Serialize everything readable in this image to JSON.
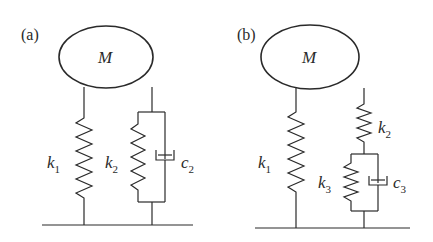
{
  "figure": {
    "panels": [
      {
        "id": "a",
        "label": "(a)",
        "mass": "M",
        "elements": [
          {
            "type": "spring",
            "symbol": "k",
            "subscript": "1",
            "arrangement": "direct to ground"
          },
          {
            "type": "spring",
            "symbol": "k",
            "subscript": "2",
            "arrangement": "parallel with c2"
          },
          {
            "type": "damper",
            "symbol": "c",
            "subscript": "2",
            "arrangement": "parallel with k2"
          }
        ]
      },
      {
        "id": "b",
        "label": "(b)",
        "mass": "M",
        "elements": [
          {
            "type": "spring",
            "symbol": "k",
            "subscript": "1",
            "arrangement": "direct to ground"
          },
          {
            "type": "spring",
            "symbol": "k",
            "subscript": "2",
            "arrangement": "series with (k3 || c3)"
          },
          {
            "type": "spring",
            "symbol": "k",
            "subscript": "3",
            "arrangement": "parallel with c3"
          },
          {
            "type": "damper",
            "symbol": "c",
            "subscript": "3",
            "arrangement": "parallel with k3"
          }
        ]
      }
    ]
  }
}
